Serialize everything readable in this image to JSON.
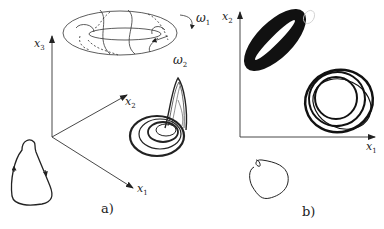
{
  "figure": {
    "panel_a": {
      "caption": "a)",
      "axes": {
        "x1": "x",
        "x1_sub": "1",
        "x2": "x",
        "x2_sub": "2",
        "x3": "x",
        "x3_sub": "3"
      },
      "torus_labels": {
        "omega1": "ω",
        "omega1_sub": "1",
        "omega2": "ω",
        "omega2_sub": "2"
      },
      "elements": [
        "3D axes x1 x2 x3",
        "torus with quasi-periodic trajectory",
        "rössler-like strange attractor",
        "limit cycle closed loop with arrows"
      ]
    },
    "panel_b": {
      "caption": "b)",
      "axes": {
        "x1": "x",
        "x1_sub": "1",
        "x2": "x",
        "x2_sub": "2"
      },
      "elements": [
        "2D axes x1 x2",
        "filled torus projection",
        "attractor projection rings",
        "small limit cycle loop"
      ]
    },
    "colors": {
      "ink": "#222222",
      "background": "#ffffff"
    }
  }
}
